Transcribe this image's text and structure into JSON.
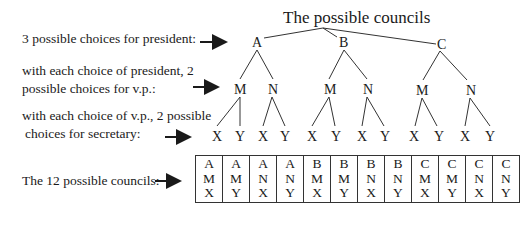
{
  "title": "The possible councils",
  "labels": {
    "president": "3 possible choices for president:",
    "vp_line1": "with each choice of  president, 2",
    "vp_line2": "possible choices for v.p.:",
    "sec_line1": "with each choice of v.p., 2 possible",
    "sec_line2": "choices for secretary:",
    "councils": "The 12 possible councils:"
  },
  "tree": {
    "level1": [
      "A",
      "B",
      "C"
    ],
    "level2": [
      "M",
      "N",
      "M",
      "N",
      "M",
      "N"
    ],
    "level3": [
      "X",
      "Y",
      "X",
      "Y",
      "X",
      "Y",
      "X",
      "Y",
      "X",
      "Y",
      "X",
      "Y"
    ]
  },
  "councils": [
    [
      "A",
      "M",
      "X"
    ],
    [
      "A",
      "M",
      "Y"
    ],
    [
      "A",
      "N",
      "X"
    ],
    [
      "A",
      "N",
      "Y"
    ],
    [
      "B",
      "M",
      "X"
    ],
    [
      "B",
      "M",
      "Y"
    ],
    [
      "B",
      "N",
      "X"
    ],
    [
      "B",
      "N",
      "Y"
    ],
    [
      "C",
      "M",
      "X"
    ],
    [
      "C",
      "M",
      "Y"
    ],
    [
      "C",
      "N",
      "X"
    ],
    [
      "C",
      "N",
      "Y"
    ]
  ]
}
